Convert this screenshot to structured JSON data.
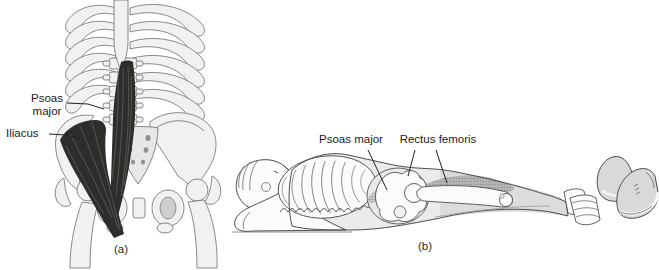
{
  "figure": {
    "panel_a": {
      "caption": "(a)",
      "labels": {
        "psoas_major": "Psoas\nmajor",
        "iliacus": "Iliacus"
      }
    },
    "panel_b": {
      "caption": "(b)",
      "labels": {
        "psoas_major": "Psoas major",
        "rectus_femoris": "Rectus femoris"
      }
    },
    "colors": {
      "muscle_highlight": "#2d2d2b",
      "muscle_shade": "#b5b5b3",
      "bone_fill": "#f1f1ef",
      "skin_shade": "#dcdcda",
      "background": "#ffffff"
    }
  }
}
